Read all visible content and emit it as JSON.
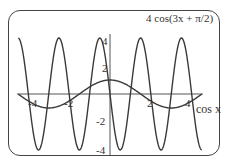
{
  "chart_data": {
    "type": "line",
    "title": "",
    "series": [
      {
        "name": "4cos(3x + π/2)",
        "function": "4*cos(3*x + pi/2)",
        "amplitude": 4,
        "period": 2.094
      },
      {
        "name": "cos x",
        "function": "cos(x)",
        "amplitude": 1,
        "period": 6.283
      }
    ],
    "xlim": [
      -4.7,
      4.7
    ],
    "ylim": [
      -4,
      4
    ],
    "x_ticks": [
      "-4",
      "-2",
      "2",
      "4"
    ],
    "y_ticks": [
      "4",
      "2",
      "-2",
      "-4"
    ],
    "annotations": [
      "4cos(3x + π/2)",
      "cos x"
    ],
    "grid": false,
    "colors": {
      "curve": "#3a3a3a",
      "axis": "#555555",
      "frame": "#444444"
    }
  },
  "labels": {
    "title_curve": "4 cos(3x + π/2)",
    "cos_label": "cos x",
    "x_m4": "-4",
    "x_m2": "-2",
    "x_2": "2",
    "x_4": "4",
    "y_4": "4",
    "y_2": "2",
    "y_m2": "-2",
    "y_m4": "-4"
  }
}
